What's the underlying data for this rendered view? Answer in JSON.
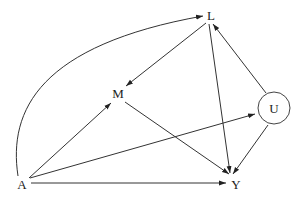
{
  "diagram": {
    "type": "causal-dag",
    "nodes": [
      {
        "id": "L",
        "label": "L",
        "x": 211,
        "y": 15,
        "shape": "text"
      },
      {
        "id": "M",
        "label": "M",
        "x": 118,
        "y": 93,
        "shape": "text"
      },
      {
        "id": "U",
        "label": "U",
        "x": 274,
        "y": 108,
        "shape": "circle",
        "r": 16
      },
      {
        "id": "A",
        "label": "A",
        "x": 22,
        "y": 184,
        "shape": "text"
      },
      {
        "id": "Y",
        "label": "Y",
        "x": 236,
        "y": 184,
        "shape": "text"
      }
    ],
    "edges": [
      {
        "from": "A",
        "to": "L",
        "curved": true
      },
      {
        "from": "A",
        "to": "M"
      },
      {
        "from": "A",
        "to": "U"
      },
      {
        "from": "A",
        "to": "Y"
      },
      {
        "from": "L",
        "to": "M"
      },
      {
        "from": "L",
        "to": "Y"
      },
      {
        "from": "M",
        "to": "Y"
      },
      {
        "from": "U",
        "to": "L"
      },
      {
        "from": "U",
        "to": "Y"
      }
    ],
    "colors": {
      "line": "#333333",
      "text": "#222222",
      "background": "#ffffff"
    }
  }
}
